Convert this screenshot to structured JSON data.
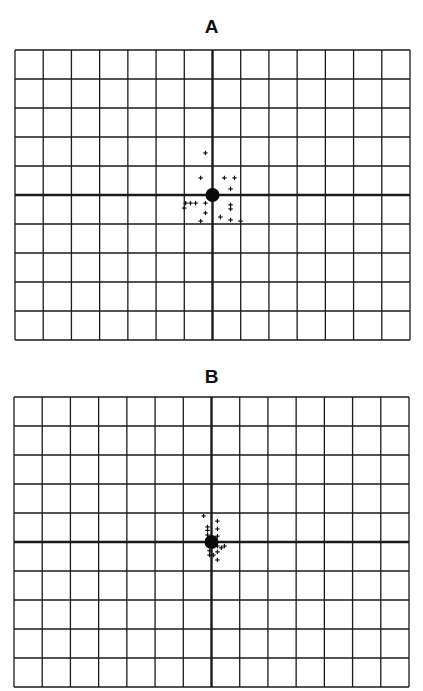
{
  "panels": [
    {
      "label": "A"
    },
    {
      "label": "B"
    }
  ],
  "chart_data": [
    {
      "type": "scatter",
      "title": "A",
      "xlabel": "",
      "ylabel": "",
      "grid": true,
      "grid_columns": 14,
      "grid_rows": 10,
      "xlim": [
        -7,
        7
      ],
      "ylim": [
        -5,
        5
      ],
      "axes_lines": "centered crosshair (x=0, y=0)",
      "center_marker": {
        "x": 0,
        "y": 0,
        "shape": "filled-circle"
      },
      "series": [
        {
          "name": "points",
          "marker": "+",
          "points": [
            [
              -0.25,
              1.45
            ],
            [
              -0.42,
              0.59
            ],
            [
              0.42,
              0.59
            ],
            [
              0.78,
              0.59
            ],
            [
              0.64,
              0.21
            ],
            [
              -0.95,
              -0.28
            ],
            [
              -0.78,
              -0.28
            ],
            [
              -0.6,
              -0.28
            ],
            [
              -0.25,
              -0.28
            ],
            [
              -1.0,
              -0.45
            ],
            [
              0.64,
              -0.34
            ],
            [
              0.64,
              -0.48
            ],
            [
              -0.25,
              -0.62
            ],
            [
              -0.42,
              -0.9
            ],
            [
              0.28,
              -0.76
            ],
            [
              0.64,
              -0.86
            ],
            [
              0.99,
              -0.9
            ]
          ]
        }
      ]
    },
    {
      "type": "scatter",
      "title": "B",
      "xlabel": "",
      "ylabel": "",
      "grid": true,
      "grid_columns": 14,
      "grid_rows": 10,
      "xlim": [
        -7,
        7
      ],
      "ylim": [
        -5,
        5
      ],
      "axes_lines": "centered crosshair (x=0, y=0)",
      "center_marker": {
        "x": 0,
        "y": 0,
        "shape": "filled-circle"
      },
      "series": [
        {
          "name": "points",
          "marker": "+",
          "points": [
            [
              -0.28,
              0.9
            ],
            [
              0.21,
              0.72
            ],
            [
              -0.14,
              0.52
            ],
            [
              -0.14,
              0.4
            ],
            [
              0.21,
              0.45
            ],
            [
              -0.14,
              0.24
            ],
            [
              0.21,
              0.2
            ],
            [
              0.21,
              -0.14
            ],
            [
              0.35,
              -0.2
            ],
            [
              0.46,
              -0.14
            ],
            [
              -0.07,
              -0.3
            ],
            [
              0.21,
              -0.34
            ],
            [
              -0.07,
              -0.45
            ],
            [
              0.07,
              -0.45
            ],
            [
              0.21,
              -0.62
            ]
          ]
        }
      ]
    }
  ]
}
